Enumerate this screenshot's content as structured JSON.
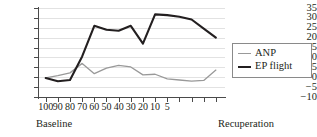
{
  "chart_data": {
    "type": "line",
    "title": "",
    "xlabel": "",
    "ylabel": "",
    "ylim": [
      -10,
      35
    ],
    "yticks": [
      35,
      30,
      25,
      20,
      15,
      10,
      5,
      0,
      -5,
      -10
    ],
    "grid": true,
    "legend_position": "right",
    "x_axis": {
      "tick_labels": [
        "100",
        "90",
        "80",
        "70",
        "60",
        "50",
        "40",
        "30",
        "20",
        "10",
        "5",
        "",
        "",
        "",
        ""
      ],
      "phase_left": "Baseline",
      "phase_right": "Recuperation"
    },
    "categories": [
      "100",
      "90",
      "80",
      "70",
      "60",
      "50",
      "40",
      "30",
      "20",
      "10",
      "5",
      "R1",
      "R2",
      "R3",
      "R4"
    ],
    "series": [
      {
        "name": "ANP",
        "color": "#999999",
        "values": [
          -0.3,
          0.8,
          2.2,
          7.0,
          1.8,
          4.6,
          6.0,
          5.2,
          1.2,
          1.5,
          -0.8,
          -1.4,
          -2.0,
          -1.6,
          3.6
        ]
      },
      {
        "name": "EP flight",
        "color": "#231f20",
        "values": [
          -0.4,
          -2.0,
          -1.4,
          10.5,
          26.0,
          24.0,
          23.5,
          26.0,
          17.0,
          31.8,
          31.4,
          30.6,
          29.2,
          24.6,
          20.0
        ]
      }
    ]
  },
  "legend": {
    "items": [
      {
        "label": "ANP"
      },
      {
        "label": "EP flight"
      }
    ]
  }
}
